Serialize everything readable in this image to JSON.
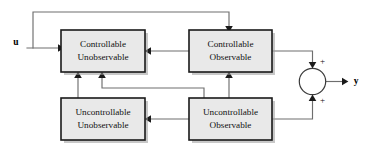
{
  "diagram": {
    "type": "block-diagram",
    "canvas": {
      "width": 371,
      "height": 150,
      "background": "#ffffff"
    },
    "style": {
      "block_fill": "#e9e9e9",
      "block_border": "#1a1a1a",
      "wire_color": "#6e6e6e",
      "arrow_color": "#1a1a1a",
      "text_color": "#111111"
    }
  },
  "blocks": [
    {
      "id": "controllable-unobservable",
      "line1": "Controllable",
      "line2": "Unobservable",
      "x": 61,
      "y": 30,
      "w": 84,
      "h": 42
    },
    {
      "id": "controllable-observable",
      "line1": "Controllable",
      "line2": "Observable",
      "x": 189,
      "y": 30,
      "w": 83,
      "h": 42
    },
    {
      "id": "uncontrollable-unobservable",
      "line1": "Uncontrollable",
      "line2": "Unobservable",
      "x": 61,
      "y": 98,
      "w": 84,
      "h": 42
    },
    {
      "id": "uncontrollable-observable",
      "line1": "Uncontrollable",
      "line2": "Observable",
      "x": 189,
      "y": 98,
      "w": 83,
      "h": 42
    }
  ],
  "summing_junction": {
    "id": "summing-junction",
    "cx": 312.5,
    "cy": 81.5,
    "r": 13.2,
    "top_sign": "+",
    "bottom_sign": "+"
  },
  "io": {
    "input_label": "u",
    "input_x": 16,
    "input_y": 43,
    "output_label": "y",
    "output_x": 356,
    "output_y": 82
  },
  "signals": [
    {
      "id": "input-u-to-controllable-unobservable",
      "from": "u",
      "to": "controllable-unobservable"
    },
    {
      "id": "feedback-u-to-controllable-observable",
      "from": "u",
      "to": "controllable-observable"
    },
    {
      "id": "controllable-observable-to-controllable-unobservable",
      "from": "controllable-observable",
      "to": "controllable-unobservable"
    },
    {
      "id": "uncontrollable-observable-to-uncontrollable-unobservable",
      "from": "uncontrollable-observable",
      "to": "uncontrollable-unobservable"
    },
    {
      "id": "uncontrollable-unobservable-to-controllable-unobservable",
      "from": "uncontrollable-unobservable",
      "to": "controllable-unobservable"
    },
    {
      "id": "uncontrollable-observable-to-controllable-unobservable",
      "from": "uncontrollable-observable",
      "to": "controllable-unobservable"
    },
    {
      "id": "uncontrollable-observable-to-controllable-observable",
      "from": "uncontrollable-observable",
      "to": "controllable-observable"
    },
    {
      "id": "controllable-observable-to-sum",
      "from": "controllable-observable",
      "to": "summing-junction"
    },
    {
      "id": "uncontrollable-observable-to-sum",
      "from": "uncontrollable-observable",
      "to": "summing-junction"
    },
    {
      "id": "sum-to-output-y",
      "from": "summing-junction",
      "to": "y"
    }
  ]
}
